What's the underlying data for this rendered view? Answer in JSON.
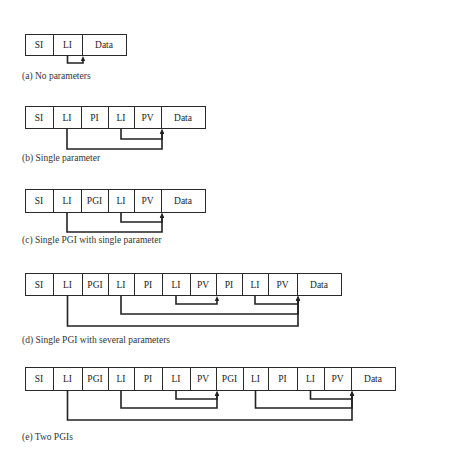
{
  "figure": {
    "panels": [
      {
        "id": "a",
        "caption": "(a) No parameters",
        "caption_y": 76,
        "top": 34,
        "bottom": 55,
        "cells": [
          {
            "label": "SI",
            "x0": 25,
            "x1": 53
          },
          {
            "label": "LI",
            "x0": 53,
            "x1": 82
          },
          {
            "label": "Data",
            "x0": 82,
            "x1": 126
          }
        ],
        "links": [
          {
            "from_cell": 1,
            "to_cell": 2,
            "y": 63
          }
        ]
      },
      {
        "id": "b",
        "caption": "(b) Single parameter",
        "caption_y": 158,
        "top": 106,
        "bottom": 128,
        "cells": [
          {
            "label": "SI",
            "x0": 25,
            "x1": 53
          },
          {
            "label": "LI",
            "x0": 53,
            "x1": 81
          },
          {
            "label": "PI",
            "x0": 81,
            "x1": 108
          },
          {
            "label": "LI",
            "x0": 108,
            "x1": 134
          },
          {
            "label": "PV",
            "x0": 134,
            "x1": 161
          },
          {
            "label": "Data",
            "x0": 161,
            "x1": 205
          }
        ],
        "links": [
          {
            "from_cell": 3,
            "to_cell": 5,
            "y": 139
          },
          {
            "from_cell": 1,
            "to_cell": 5,
            "y": 149
          }
        ]
      },
      {
        "id": "c",
        "caption": "(c) Single PGI with single parameter",
        "caption_y": 240,
        "top": 189,
        "bottom": 212,
        "cells": [
          {
            "label": "SI",
            "x0": 25,
            "x1": 53
          },
          {
            "label": "LI",
            "x0": 53,
            "x1": 81
          },
          {
            "label": "PGI",
            "x0": 81,
            "x1": 108
          },
          {
            "label": "LI",
            "x0": 108,
            "x1": 134
          },
          {
            "label": "PV",
            "x0": 134,
            "x1": 161
          },
          {
            "label": "Data",
            "x0": 161,
            "x1": 205
          }
        ],
        "links": [
          {
            "from_cell": 3,
            "to_cell": 5,
            "y": 222
          },
          {
            "from_cell": 1,
            "to_cell": 5,
            "y": 232
          }
        ]
      },
      {
        "id": "d",
        "caption": "(d) Single PGI with several parameters",
        "caption_y": 340,
        "top": 273,
        "bottom": 295,
        "cells": [
          {
            "label": "SI",
            "x0": 25,
            "x1": 53
          },
          {
            "label": "LI",
            "x0": 53,
            "x1": 82
          },
          {
            "label": "PGI",
            "x0": 82,
            "x1": 108
          },
          {
            "label": "LI",
            "x0": 108,
            "x1": 134
          },
          {
            "label": "PI",
            "x0": 134,
            "x1": 162
          },
          {
            "label": "LI",
            "x0": 162,
            "x1": 190
          },
          {
            "label": "PV",
            "x0": 190,
            "x1": 216
          },
          {
            "label": "PI",
            "x0": 216,
            "x1": 242
          },
          {
            "label": "LI",
            "x0": 242,
            "x1": 268
          },
          {
            "label": "PV",
            "x0": 268,
            "x1": 297
          },
          {
            "label": "Data",
            "x0": 297,
            "x1": 341
          }
        ],
        "links": [
          {
            "from_cell": 5,
            "to_cell": 7,
            "y": 304
          },
          {
            "from_cell": 8,
            "to_cell": 10,
            "y": 304
          },
          {
            "from_cell": 3,
            "to_cell": 10,
            "y": 314
          },
          {
            "from_cell": 1,
            "to_cell": 10,
            "y": 326
          }
        ]
      },
      {
        "id": "e",
        "caption": "(e) Two PGIs",
        "caption_y": 437,
        "top": 367,
        "bottom": 390,
        "cells": [
          {
            "label": "SI",
            "x0": 25,
            "x1": 53
          },
          {
            "label": "LI",
            "x0": 53,
            "x1": 82
          },
          {
            "label": "PGI",
            "x0": 82,
            "x1": 108
          },
          {
            "label": "LI",
            "x0": 108,
            "x1": 134
          },
          {
            "label": "PI",
            "x0": 134,
            "x1": 162
          },
          {
            "label": "LI",
            "x0": 162,
            "x1": 190
          },
          {
            "label": "PV",
            "x0": 190,
            "x1": 216
          },
          {
            "label": "PGI",
            "x0": 216,
            "x1": 243
          },
          {
            "label": "LI",
            "x0": 243,
            "x1": 268
          },
          {
            "label": "PI",
            "x0": 268,
            "x1": 297
          },
          {
            "label": "LI",
            "x0": 297,
            "x1": 324
          },
          {
            "label": "PV",
            "x0": 324,
            "x1": 351
          },
          {
            "label": "Data",
            "x0": 351,
            "x1": 395
          }
        ],
        "links": [
          {
            "from_cell": 5,
            "to_cell": 7,
            "y": 399
          },
          {
            "from_cell": 3,
            "to_cell": 7,
            "y": 408
          },
          {
            "from_cell": 10,
            "to_cell": 12,
            "y": 399
          },
          {
            "from_cell": 8,
            "to_cell": 12,
            "y": 408
          },
          {
            "from_cell": 1,
            "to_cell": 12,
            "y": 420
          }
        ]
      }
    ]
  }
}
